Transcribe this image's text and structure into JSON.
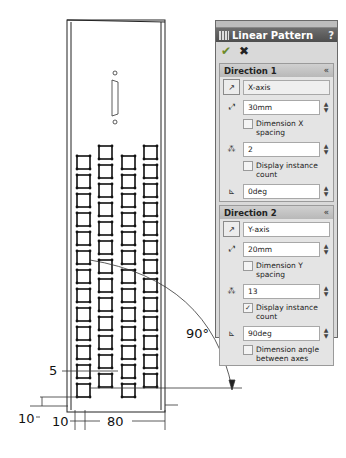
{
  "panel": {
    "title": "Linear Pattern",
    "help_label": "?",
    "ok_icon": "checkmark-icon",
    "cancel_icon": "x-icon",
    "direction1": {
      "header": "Direction 1",
      "collapse_icon": "chevron-up-double-icon",
      "direction_value": "X-axis",
      "spacing_value": "30mm",
      "dimension_spacing_label": "Dimension X spacing",
      "dimension_spacing_checked": false,
      "instances_value": "2",
      "display_instance_label": "Display instance count",
      "display_instance_checked": false,
      "angle_value": "0deg"
    },
    "direction2": {
      "header": "Direction 2",
      "collapse_icon": "chevron-up-double-icon",
      "direction_value": "Y-axis",
      "spacing_value": "20mm",
      "dimension_spacing_label": "Dimension Y spacing",
      "dimension_spacing_checked": false,
      "instances_value": "13",
      "display_instance_label": "Display instance count",
      "display_instance_checked": true,
      "angle_value": "90deg",
      "dimension_angle_label": "Dimension angle between axes",
      "dimension_angle_checked": false
    }
  },
  "drawing": {
    "pattern_columns": 2,
    "pattern_rows": 13,
    "dimensions": {
      "angle": "90°",
      "row_offset": "5",
      "bottom_offset": "10",
      "left_offset": "10",
      "x_distance": "80"
    }
  }
}
